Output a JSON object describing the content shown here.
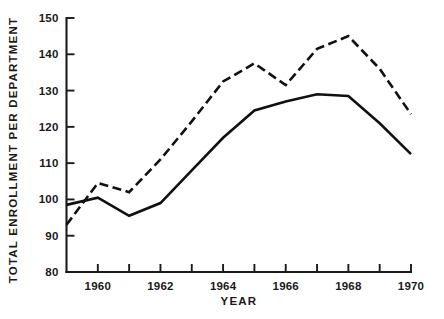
{
  "chart_data": {
    "type": "line",
    "title": "",
    "xlabel": "YEAR",
    "ylabel": "TOTAL ENROLLMENT PER DEPARTMENT",
    "xlim": [
      1959,
      1970
    ],
    "ylim": [
      80,
      150
    ],
    "x": [
      1959,
      1960,
      1961,
      1962,
      1963,
      1964,
      1965,
      1966,
      1967,
      1968,
      1969,
      1970
    ],
    "grid": false,
    "legend": "none",
    "x_tick_values": [
      1959,
      1960,
      1961,
      1962,
      1963,
      1964,
      1965,
      1966,
      1967,
      1968,
      1969,
      1970
    ],
    "x_tick_labels": [
      "",
      "1960",
      "",
      "1962",
      "",
      "1964",
      "",
      "1966",
      "",
      "1968",
      "",
      "1970"
    ],
    "y_tick_values": [
      80,
      90,
      100,
      110,
      120,
      130,
      140,
      150
    ],
    "y_tick_labels": [
      "80",
      "90",
      "100",
      "110",
      "120",
      "130",
      "140",
      "150"
    ],
    "series": [
      {
        "name": "dashed-series",
        "style": "dashed",
        "values": [
          93,
          104.5,
          102,
          111,
          121.5,
          132.5,
          137.5,
          131.5,
          141.5,
          145,
          136,
          123.5
        ]
      },
      {
        "name": "solid-series",
        "style": "solid",
        "values": [
          98.5,
          100.5,
          95.5,
          99,
          108,
          117,
          124.5,
          127,
          129,
          128.5,
          121,
          112.5
        ]
      }
    ]
  },
  "axis_titles": {
    "x": "YEAR",
    "y": "TOTAL ENROLLMENT PER DEPARTMENT"
  }
}
